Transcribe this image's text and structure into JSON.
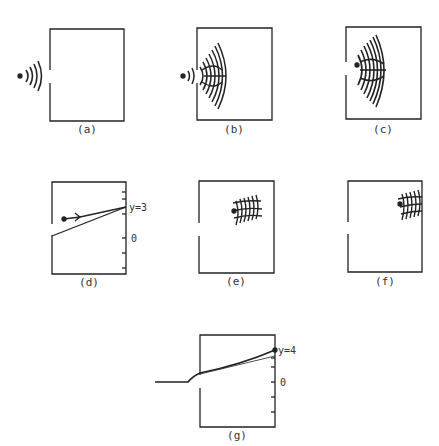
{
  "figure": {
    "panels": [
      {
        "id": "a",
        "label": "(a)",
        "description": "point source emitting waves toward slit"
      },
      {
        "id": "b",
        "label": "(b)",
        "description": "waves passing through slit and spreading"
      },
      {
        "id": "c",
        "label": "(c)",
        "description": "wave packet inside box moving right"
      },
      {
        "id": "d",
        "label": "(d)",
        "description": "classical trajectory from slit reaching wall",
        "axis_label": "y=3",
        "zero_label": "0"
      },
      {
        "id": "e",
        "label": "(e)",
        "description": "localized wave packet inside box"
      },
      {
        "id": "f",
        "label": "(f)",
        "description": "wave packet arriving at right wall"
      },
      {
        "id": "g",
        "label": "(g)",
        "description": "trajectory from outside through slit to wall",
        "axis_label": "y=4",
        "zero_label": "0"
      }
    ]
  },
  "colors": {
    "ink": "#222222",
    "background": "#ffffff"
  }
}
